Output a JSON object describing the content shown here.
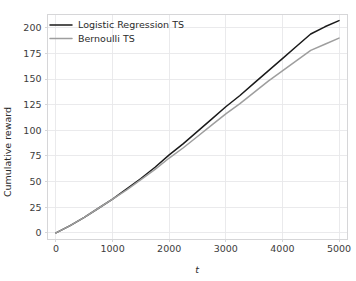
{
  "top_strip": {
    "clipped_glyphs": "▪▣▪▫▪▤ · ▪▪▫▣▪▪ ▫▪ ▪ ▫ ▪▪ ▫▪▫▪▫▪"
  },
  "chart_data": {
    "type": "line",
    "title": "",
    "xlabel": "t",
    "ylabel": "Cumulative reward",
    "xlim": [
      -150,
      5150
    ],
    "ylim": [
      -6,
      213
    ],
    "xticks": [
      0,
      1000,
      2000,
      3000,
      4000,
      5000
    ],
    "yticks": [
      0,
      25,
      50,
      75,
      100,
      125,
      150,
      175,
      200
    ],
    "grid": true,
    "legend_position": "upper left",
    "x": [
      0,
      250,
      500,
      750,
      1000,
      1250,
      1500,
      1750,
      2000,
      2250,
      2500,
      2750,
      3000,
      3250,
      3500,
      3750,
      4000,
      4250,
      4500,
      4750,
      5000
    ],
    "series": [
      {
        "name": "Logistic Regression TS",
        "color": "#1a1a1a",
        "width": 1.5,
        "values": [
          0,
          7,
          15,
          24,
          33,
          43,
          53,
          64,
          76,
          87,
          99,
          111,
          123,
          134,
          146,
          158,
          170,
          182,
          194,
          201,
          207
        ]
      },
      {
        "name": "Bernoulli TS",
        "color": "#9e9e9e",
        "width": 1.5,
        "values": [
          0,
          7,
          15,
          24,
          33,
          42,
          52,
          62,
          73,
          83,
          94,
          105,
          116,
          126,
          137,
          148,
          158,
          168,
          178,
          184,
          190
        ]
      }
    ]
  },
  "legend": {
    "items": [
      {
        "label": "Logistic Regression TS"
      },
      {
        "label": "Bernoulli TS"
      }
    ]
  },
  "axes": {
    "y_title": "Cumulative reward",
    "x_title": "t",
    "y_tick_labels": [
      "0",
      "25",
      "50",
      "75",
      "100",
      "125",
      "150",
      "175",
      "200"
    ],
    "x_tick_labels": [
      "0",
      "1000",
      "2000",
      "3000",
      "4000",
      "5000"
    ]
  },
  "colors": {
    "background": "#ffffff",
    "grid": "#e8e8ea",
    "spine": "#d6d6d8",
    "series_primary": "#1a1a1a",
    "series_secondary": "#9e9e9e",
    "text": "#2b2b2b"
  }
}
